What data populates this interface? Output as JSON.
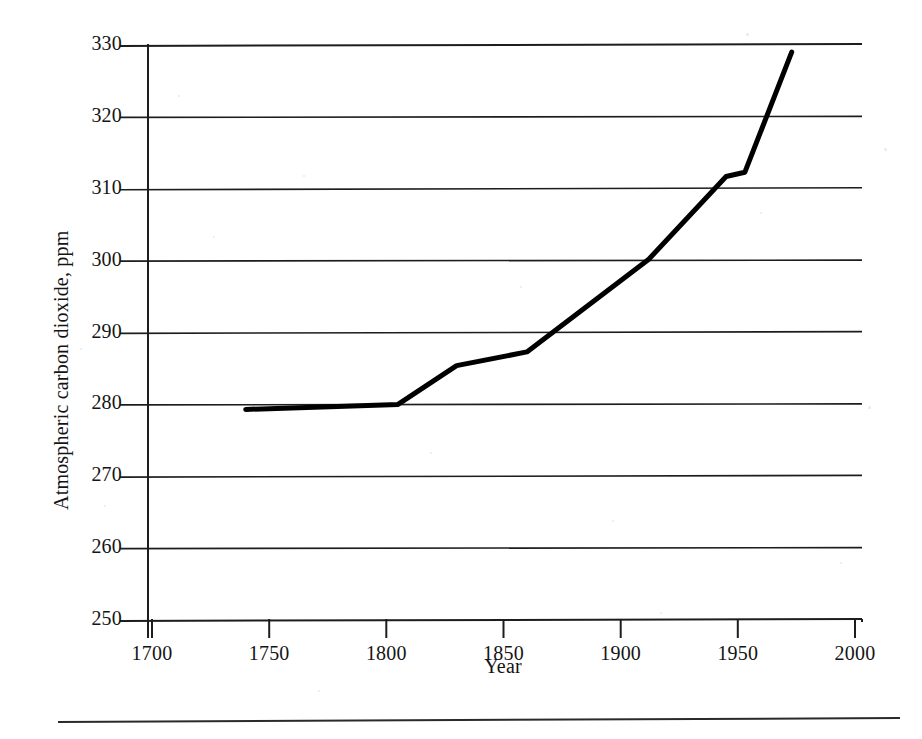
{
  "chart_data": {
    "type": "line",
    "title": "",
    "subtitle": "",
    "xlabel": "Year",
    "ylabel": "Atmospheric carbon dioxide, ppm",
    "xlim": [
      1700,
      2000
    ],
    "ylim": [
      250,
      330
    ],
    "xticks": [
      1700,
      1750,
      1800,
      1850,
      1900,
      1950,
      2000
    ],
    "xtick_labels": [
      "1700",
      "1750",
      "1800",
      "1850",
      "1900",
      "1950",
      "2000"
    ],
    "yticks": [
      250,
      260,
      270,
      280,
      290,
      300,
      310,
      320,
      330
    ],
    "ytick_labels": [
      "250",
      "260",
      "270",
      "280",
      "290",
      "300",
      "310",
      "320",
      "330"
    ],
    "grid": "horizontal",
    "legend": "none",
    "line_color": "#000000",
    "line_width_px": 5,
    "series": [
      {
        "name": "Atmospheric carbon dioxide",
        "x": [
          1740,
          1805,
          1830,
          1860,
          1912,
          1945,
          1953,
          1973
        ],
        "y": [
          279.3,
          280.0,
          285.4,
          287.3,
          300.2,
          311.7,
          312.3,
          329.0
        ]
      }
    ],
    "annotations": []
  },
  "axis": {
    "y_axis_label": "Atmospheric carbon dioxide, ppm",
    "x_axis_label": "Year"
  },
  "figure": {
    "footer_rule": true,
    "background_color": "#ffffff",
    "ink_color": "#141414"
  }
}
